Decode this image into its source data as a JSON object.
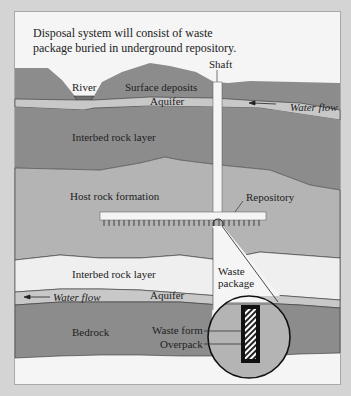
{
  "caption": {
    "line1": "Disposal system will consist of waste",
    "line2": "package buried in underground repository."
  },
  "labels": {
    "shaft": "Shaft",
    "river": "River",
    "surface_deposits": "Surface deposits",
    "aquifer_top": "Aquifer",
    "water_flow_top": "Water flow",
    "interbed_top": "Interbed rock layer",
    "host_rock": "Host rock formation",
    "repository": "Repository",
    "interbed_bottom": "Interbed rock layer",
    "waste_package_1": "Waste",
    "waste_package_2": "package",
    "water_flow_bottom": "Water flow",
    "aquifer_bottom": "Aquifer",
    "bedrock": "Bedrock",
    "waste_form": "Waste form",
    "overpack": "Overpack"
  },
  "colors": {
    "background": "#d4d4d4",
    "panel": "#f5f5f5",
    "dark_layer": "#8c8c8c",
    "aquifer": "#c8c8c8",
    "host_rock": "#b4b4b4",
    "interbed_light": "#efefef",
    "bedrock": "#8c8c8c"
  }
}
